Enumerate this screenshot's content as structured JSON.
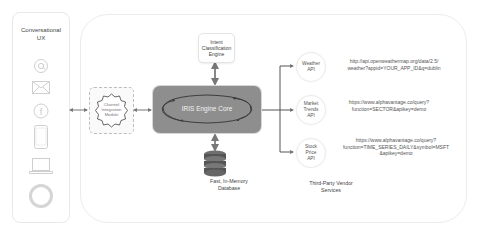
{
  "ux_panel": {
    "title": "Conversational UX",
    "title_line1": "Conversational",
    "title_line2": "UX",
    "icons": [
      "at-sign-icon",
      "envelope-icon",
      "facebook-icon",
      "smartphone-icon",
      "laptop-icon",
      "voice-assistant-ring-icon"
    ]
  },
  "channel_module": {
    "line1": "Channel",
    "line2": "Integration",
    "line3": "Module"
  },
  "core": {
    "label": "IRIS Engine Core",
    "color": "#8e8e8e"
  },
  "intent_engine": {
    "line1": "Intent",
    "line2": "Classification",
    "line3": "Engine"
  },
  "database": {
    "line1": "Fast, In-Memory",
    "line2": "Database"
  },
  "apis": [
    {
      "name_line1": "Weather",
      "name_line2": "API",
      "name_line3": "",
      "url_line1": "http://api.openweathermap.org/data/2.5/",
      "url_line2": "weather?appid=YOUR_APP_ID&q=dublin",
      "url_line3": ""
    },
    {
      "name_line1": "Market",
      "name_line2": "Trends",
      "name_line3": "API",
      "url_line1": "https://www.alphavantage.co/query?",
      "url_line2": "function=SECTOR&apikey=demo",
      "url_line3": ""
    },
    {
      "name_line1": "Stock",
      "name_line2": "Price",
      "name_line3": "API",
      "url_line1": "https://www.alphavantage.co/query?",
      "url_line2": "function=TIME_SERIES_DAILY&symbol=MSFT",
      "url_line3": "&apikey=demo"
    }
  ],
  "vendor_services": {
    "line1": "Third-Party Vendor",
    "line2": "Services"
  }
}
